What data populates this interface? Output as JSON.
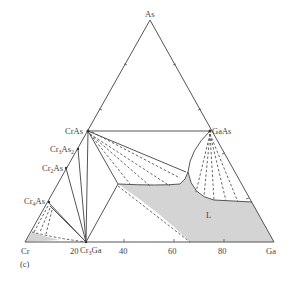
{
  "diagram": {
    "type": "ternary-phase-diagram",
    "vertices": {
      "top": "As",
      "left": "Cr",
      "right": "Ga"
    },
    "compounds": [
      {
        "name": "CrAs",
        "side": "Cr-As"
      },
      {
        "name": "Cr3As2",
        "side": "Cr-As",
        "base": "Cr",
        "s1": "3",
        "mid": "As",
        "s2": "2"
      },
      {
        "name": "Cr2As",
        "side": "Cr-As",
        "base": "Cr",
        "s1": "2",
        "mid": "As"
      },
      {
        "name": "Cr4As",
        "side": "Cr-As",
        "base": "Cr",
        "s1": "4",
        "mid": "As"
      },
      {
        "name": "GaAs",
        "side": "As-Ga"
      },
      {
        "name": "Cr3Ga",
        "side": "Cr-Ga",
        "base": "Cr",
        "s1": "3",
        "mid": "Ga"
      }
    ],
    "axis_ticks": [
      "20",
      "40",
      "60",
      "80"
    ],
    "region_label": "L",
    "panel_label": "(c)",
    "colors": {
      "line": "#555555",
      "fill": "#d4d4d4",
      "text": "#444444"
    }
  }
}
